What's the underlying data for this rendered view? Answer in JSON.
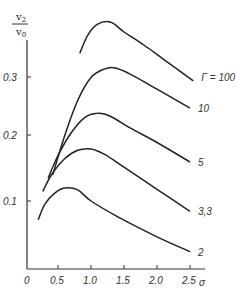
{
  "chart_data": {
    "type": "line",
    "title": "",
    "xlabel": "σ",
    "ylabel": "v2/v0",
    "ylabel_numerator": "v",
    "ylabel_numerator_sub": "2",
    "ylabel_denominator": "v",
    "ylabel_denominator_sub": "0",
    "xlim": [
      0,
      2.7
    ],
    "ylim": [
      0,
      0.39
    ],
    "grid": false,
    "legend_position": "inline-right",
    "x_ticks": [
      "0",
      "0.5",
      "1.0",
      "1.5",
      "2.0",
      "2.5"
    ],
    "y_ticks": [
      "0.1",
      "0.2",
      "0.3"
    ],
    "series": [
      {
        "name": "Γ = 100",
        "label": "Γ = 100",
        "x": [
          0.83,
          0.95,
          1.1,
          1.3,
          1.5,
          1.8,
          2.1,
          2.55
        ],
        "y": [
          0.327,
          0.355,
          0.372,
          0.375,
          0.36,
          0.34,
          0.318,
          0.285
        ]
      },
      {
        "name": "10",
        "label": "10",
        "x": [
          0.42,
          0.6,
          0.8,
          1.0,
          1.2,
          1.35,
          1.6,
          2.0,
          2.5
        ],
        "y": [
          0.14,
          0.2,
          0.255,
          0.29,
          0.303,
          0.305,
          0.295,
          0.272,
          0.243
        ]
      },
      {
        "name": "5",
        "label": "5",
        "x": [
          0.35,
          0.5,
          0.7,
          0.9,
          1.1,
          1.3,
          1.6,
          2.0,
          2.5
        ],
        "y": [
          0.135,
          0.17,
          0.205,
          0.228,
          0.235,
          0.23,
          0.212,
          0.19,
          0.16
        ]
      },
      {
        "name": "3,3",
        "label": "3,3",
        "x": [
          0.27,
          0.4,
          0.6,
          0.8,
          1.0,
          1.2,
          1.5,
          2.0,
          2.5
        ],
        "y": [
          0.115,
          0.14,
          0.165,
          0.178,
          0.18,
          0.172,
          0.152,
          0.118,
          0.084
        ]
      },
      {
        "name": "2",
        "label": "2",
        "x": [
          0.2,
          0.3,
          0.45,
          0.6,
          0.8,
          1.0,
          1.4,
          2.0,
          2.5
        ],
        "y": [
          0.071,
          0.095,
          0.112,
          0.12,
          0.117,
          0.1,
          0.076,
          0.045,
          0.022
        ]
      }
    ],
    "colors": {
      "line": "#222222",
      "axis": "#333333",
      "text": "#333333",
      "background": "#ffffff"
    }
  }
}
